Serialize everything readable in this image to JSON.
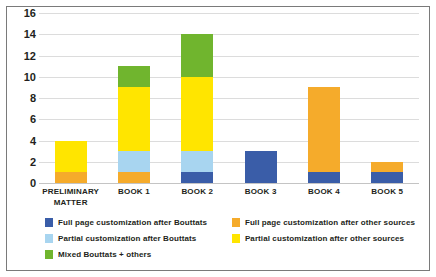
{
  "chart_data": {
    "type": "bar",
    "stacked": true,
    "title": "",
    "subtitle": "",
    "xlabel": "",
    "ylabel": "",
    "ylim": [
      0,
      16
    ],
    "ytick_step": 2,
    "yticks": [
      16,
      14,
      12,
      10,
      8,
      6,
      4,
      2,
      0
    ],
    "grid": true,
    "legend_position": "bottom",
    "categories": [
      "PRELIMINARY MATTER",
      "BOOK 1",
      "BOOK 2",
      "BOOK 3",
      "BOOK 4",
      "BOOK 5"
    ],
    "category_lines": [
      [
        "PRELIMINARY",
        "MATTER"
      ],
      [
        "BOOK 1"
      ],
      [
        "BOOK 2"
      ],
      [
        "BOOK 3"
      ],
      [
        "BOOK 4"
      ],
      [
        "BOOK 5"
      ]
    ],
    "series": [
      {
        "name": "Full page customization after Bouttats",
        "color": "#3A5DA8",
        "values": [
          0,
          0,
          1,
          3,
          1,
          1
        ]
      },
      {
        "name": "Partial customization after Bouttats",
        "color": "#A8D5F0",
        "values": [
          0,
          2,
          2,
          0,
          0,
          0
        ]
      },
      {
        "name": "Full page customization after other sources",
        "color": "#F5AB2B",
        "values": [
          1,
          1,
          0,
          0,
          8,
          1
        ]
      },
      {
        "name": "Partial customization after other sources",
        "color": "#FFE500",
        "values": [
          3,
          6,
          7,
          0,
          0,
          0
        ]
      },
      {
        "name": "Mixed Bouttats + others",
        "color": "#70B52E",
        "values": [
          0,
          2,
          4,
          0,
          0,
          0
        ]
      }
    ],
    "stack_order": [
      "Full page customization after Bouttats",
      "Full page customization after other sources",
      "Partial customization after Bouttats",
      "Partial customization after other sources",
      "Mixed Bouttats + others"
    ],
    "totals": [
      4,
      11,
      14,
      3,
      9,
      2
    ]
  },
  "legend": {
    "entries": [
      {
        "label": "Full page customization after Bouttats",
        "color": "#3A5DA8"
      },
      {
        "label": "Full page customization after other sources",
        "color": "#F5AB2B"
      },
      {
        "label": "Partial customization after Bouttats",
        "color": "#A8D5F0"
      },
      {
        "label": "Partial customization after other sources",
        "color": "#FFE500"
      },
      {
        "label": "Mixed Bouttats + others",
        "color": "#70B52E"
      }
    ]
  },
  "colors": {
    "full_page_bouttats": "#3A5DA8",
    "partial_bouttats": "#A8D5F0",
    "full_page_other": "#F5AB2B",
    "partial_other": "#FFE500",
    "mixed": "#70B52E",
    "gridline": "#dcdcdc",
    "frame_border": "#7a7a7a",
    "text": "#231f20",
    "background": "#ffffff"
  }
}
